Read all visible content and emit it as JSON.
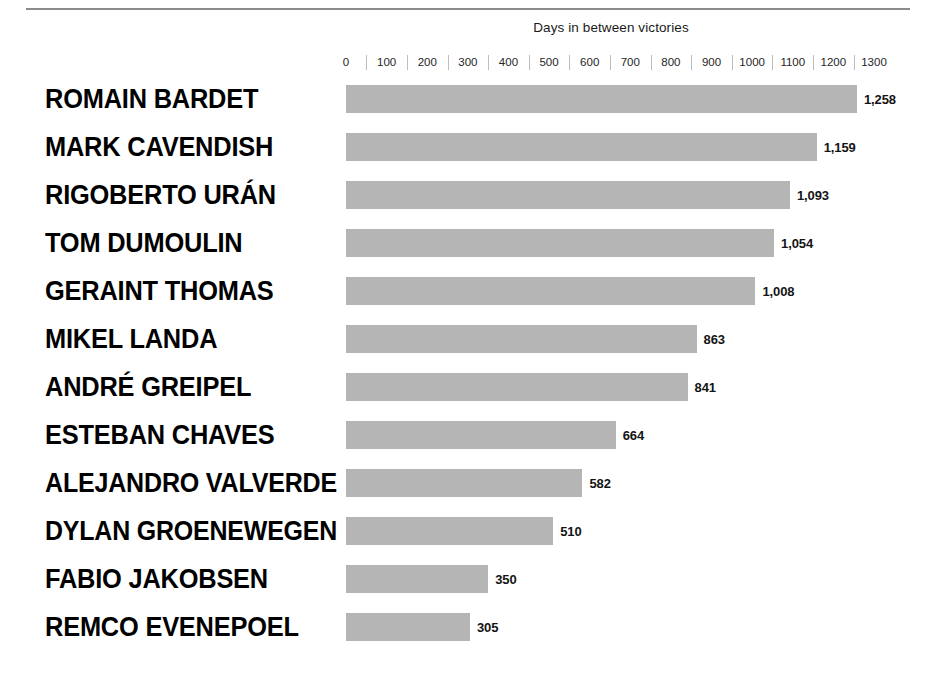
{
  "chart_data": {
    "type": "bar",
    "orientation": "horizontal",
    "title": "Days in between victories",
    "xlabel": "Days in between victories",
    "ylabel": "",
    "xlim": [
      0,
      1300
    ],
    "grid": false,
    "legend": false,
    "tick_labels": [
      "0",
      "100",
      "200",
      "300",
      "400",
      "500",
      "600",
      "700",
      "800",
      "900",
      "1000",
      "1100",
      "1200",
      "1300"
    ],
    "tick_values": [
      0,
      100,
      200,
      300,
      400,
      500,
      600,
      700,
      800,
      900,
      1000,
      1100,
      1200,
      1300
    ],
    "categories": [
      "ROMAIN BARDET",
      "MARK CAVENDISH",
      "RIGOBERTO URÁN",
      "TOM DUMOULIN",
      "GERAINT THOMAS",
      "MIKEL LANDA",
      "ANDRÉ GREIPEL",
      "ESTEBAN CHAVES",
      "ALEJANDRO VALVERDE",
      "DYLAN GROENEWEGEN",
      "FABIO JAKOBSEN",
      "REMCO EVENEPOEL"
    ],
    "values": [
      1258,
      1159,
      1093,
      1054,
      1008,
      863,
      841,
      664,
      582,
      510,
      350,
      305
    ],
    "value_labels": [
      "1,258",
      "1,159",
      "1,093",
      "1,054",
      "1,008",
      "863",
      "841",
      "664",
      "582",
      "510",
      "350",
      "305"
    ],
    "bar_color": "#b5b5b5",
    "label_color": "#000000"
  },
  "ghost_text": ""
}
